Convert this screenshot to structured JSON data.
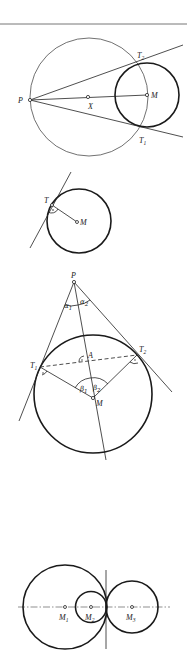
{
  "figures": [
    {
      "id": "fig1-tangents-from-external-point",
      "labels": {
        "P": "P",
        "X": "X",
        "M": "M",
        "T2": "T",
        "T2_sub": "2",
        "T1": "T",
        "T1_sub": "1"
      }
    },
    {
      "id": "fig2-tangent-perpendicular-radius",
      "labels": {
        "T": "T",
        "M": "M"
      }
    },
    {
      "id": "fig3-tangent-angles",
      "labels": {
        "P": "P",
        "A": "A",
        "M": "M",
        "T1": "T",
        "T1_sub": "1",
        "T2": "T",
        "T2_sub": "2",
        "alpha1": "α",
        "alpha1_sub": "1",
        "alpha2": "α",
        "alpha2_sub": "2",
        "beta1": "β",
        "beta1_sub": "1",
        "beta2": "β",
        "beta2_sub": "2"
      }
    },
    {
      "id": "fig4-touching-circles",
      "labels": {
        "M1": "M",
        "M1_sub": "1",
        "M2": "M",
        "M2_sub": "2",
        "M3": "M",
        "M3_sub": "3"
      }
    }
  ]
}
